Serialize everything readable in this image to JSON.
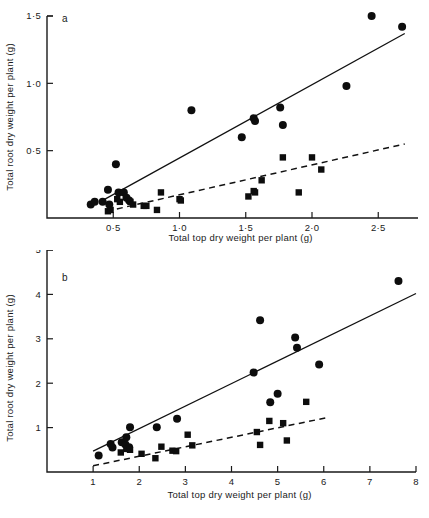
{
  "figure": {
    "background_color": "#ffffff",
    "ink_color": "#111111",
    "panels": [
      "a",
      "b"
    ]
  },
  "chart_data": [
    {
      "id": "panel-a",
      "panel_label": "a",
      "type": "scatter",
      "title": "",
      "xlabel": "Total top dry weight per plant (g)",
      "ylabel": "Total root dry weight per plant (g)",
      "xlim": [
        0.0,
        2.8
      ],
      "ylim": [
        0.0,
        1.5
      ],
      "xticks": [
        0.5,
        1.0,
        1.5,
        2.0,
        2.5
      ],
      "xtick_labels": [
        "0·5",
        "1·0",
        "1·5",
        "2·0",
        "2·5"
      ],
      "yticks": [
        0.5,
        1.0,
        1.5
      ],
      "ytick_labels": [
        "0·5",
        "1·0",
        "1·5"
      ],
      "grid": false,
      "legend": "none",
      "series": [
        {
          "name": "circles",
          "marker": "circle",
          "points": [
            [
              0.33,
              0.1
            ],
            [
              0.36,
              0.12
            ],
            [
              0.42,
              0.12
            ],
            [
              0.46,
              0.21
            ],
            [
              0.47,
              0.1
            ],
            [
              0.52,
              0.4
            ],
            [
              0.54,
              0.19
            ],
            [
              0.58,
              0.19
            ],
            [
              0.6,
              0.15
            ],
            [
              0.62,
              0.13
            ],
            [
              1.09,
              0.8
            ],
            [
              1.47,
              0.6
            ],
            [
              1.56,
              0.74
            ],
            [
              1.57,
              0.72
            ],
            [
              1.76,
              0.82
            ],
            [
              1.78,
              0.69
            ],
            [
              2.26,
              0.98
            ],
            [
              2.45,
              1.5
            ],
            [
              2.68,
              1.42
            ]
          ],
          "fit_line": {
            "style": "solid",
            "x0": 0.4,
            "y0": 0.12,
            "x1": 2.7,
            "y1": 1.37
          }
        },
        {
          "name": "squares",
          "marker": "square",
          "points": [
            [
              0.46,
              0.05
            ],
            [
              0.48,
              0.06
            ],
            [
              0.53,
              0.14
            ],
            [
              0.55,
              0.12
            ],
            [
              0.63,
              0.12
            ],
            [
              0.65,
              0.1
            ],
            [
              0.73,
              0.09
            ],
            [
              0.75,
              0.09
            ],
            [
              0.83,
              0.06
            ],
            [
              0.86,
              0.19
            ],
            [
              1.0,
              0.14
            ],
            [
              1.01,
              0.13
            ],
            [
              1.52,
              0.16
            ],
            [
              1.56,
              0.2
            ],
            [
              1.57,
              0.19
            ],
            [
              1.62,
              0.28
            ],
            [
              1.78,
              0.45
            ],
            [
              1.9,
              0.19
            ],
            [
              2.0,
              0.45
            ],
            [
              2.07,
              0.36
            ]
          ],
          "fit_line": {
            "style": "dashed",
            "x0": 0.45,
            "y0": 0.05,
            "x1": 2.7,
            "y1": 0.55
          }
        }
      ]
    },
    {
      "id": "panel-b",
      "panel_label": "b",
      "type": "scatter",
      "title": "",
      "xlabel": "Total top dry weight per plant (g)",
      "ylabel": "Total root dry weight per plant (g)",
      "xlim": [
        0.0,
        8.0
      ],
      "ylim": [
        0.0,
        5.0
      ],
      "xticks": [
        1,
        2,
        3,
        4,
        5,
        6,
        7,
        8
      ],
      "xtick_labels": [
        "1",
        "2",
        "3",
        "4",
        "5",
        "6",
        "7",
        "8"
      ],
      "yticks": [
        1,
        2,
        3,
        4,
        5
      ],
      "ytick_labels": [
        "1",
        "2",
        "3",
        "4",
        "5"
      ],
      "grid": false,
      "legend": "none",
      "series": [
        {
          "name": "circles",
          "marker": "circle",
          "points": [
            [
              1.12,
              0.37
            ],
            [
              1.38,
              0.63
            ],
            [
              1.42,
              0.55
            ],
            [
              1.62,
              0.67
            ],
            [
              1.7,
              0.62
            ],
            [
              1.72,
              0.78
            ],
            [
              1.78,
              0.56
            ],
            [
              1.8,
              1.01
            ],
            [
              2.38,
              1.01
            ],
            [
              2.82,
              1.2
            ],
            [
              4.48,
              2.24
            ],
            [
              4.62,
              3.42
            ],
            [
              4.84,
              1.57
            ],
            [
              5.0,
              1.76
            ],
            [
              5.38,
              3.03
            ],
            [
              5.42,
              2.8
            ],
            [
              5.9,
              2.42
            ],
            [
              7.62,
              4.3
            ]
          ],
          "fit_line": {
            "style": "solid",
            "x0": 1.0,
            "y0": 0.47,
            "x1": 8.0,
            "y1": 4.02
          }
        },
        {
          "name": "squares",
          "marker": "square",
          "points": [
            [
              1.6,
              0.44
            ],
            [
              1.72,
              0.52
            ],
            [
              1.8,
              0.5
            ],
            [
              2.05,
              0.41
            ],
            [
              2.35,
              0.31
            ],
            [
              2.48,
              0.57
            ],
            [
              2.72,
              0.48
            ],
            [
              2.8,
              0.47
            ],
            [
              3.05,
              0.84
            ],
            [
              3.15,
              0.6
            ],
            [
              4.55,
              0.9
            ],
            [
              4.62,
              0.61
            ],
            [
              4.82,
              1.15
            ],
            [
              5.12,
              1.1
            ],
            [
              5.2,
              0.71
            ],
            [
              5.62,
              1.58
            ]
          ],
          "fit_line": {
            "style": "dashed",
            "x0": 1.0,
            "y0": 0.14,
            "x1": 6.05,
            "y1": 1.22
          }
        }
      ]
    }
  ]
}
